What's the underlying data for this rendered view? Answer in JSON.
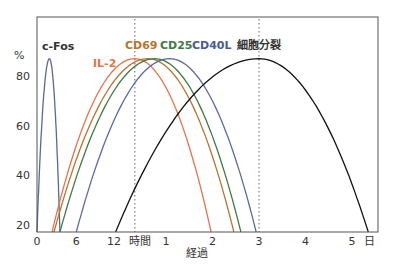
{
  "chart_data": {
    "type": "line",
    "title": "",
    "xlabel": "経過",
    "ylabel": "%",
    "ylim": [
      17,
      100
    ],
    "grid": false,
    "legend": "inline labels above curves",
    "x_axis": {
      "hour_ticks": [
        {
          "label": "0",
          "unit": "h",
          "value": 0
        },
        {
          "label": "6",
          "unit": "h",
          "value": 6
        },
        {
          "label": "12",
          "unit": "h",
          "value": 12
        }
      ],
      "hour_unit_label": "時間",
      "day_ticks": [
        {
          "label": "1",
          "unit": "d",
          "value": 1
        },
        {
          "label": "2",
          "unit": "d",
          "value": 2
        },
        {
          "label": "3",
          "unit": "d",
          "value": 3
        },
        {
          "label": "4",
          "unit": "d",
          "value": 4
        },
        {
          "label": "5",
          "unit": "d",
          "value": 5
        }
      ],
      "day_unit_label": "日"
    },
    "y_ticks": [
      80,
      60,
      40,
      20
    ],
    "reference_lines": [
      {
        "unit": "d",
        "value": 0.33,
        "style": "dotted"
      },
      {
        "unit": "d",
        "value": 3,
        "style": "dotted"
      }
    ],
    "series": [
      {
        "name": "c-Fos",
        "color": "#5a6a96",
        "label_weight": "normal",
        "label_color": "#333333",
        "start": {
          "unit": "h",
          "value": 0
        },
        "peak": {
          "unit": "h",
          "value": 1.9,
          "y": 87
        },
        "end": {
          "unit": "h",
          "value": 3.5
        }
      },
      {
        "name": "IL-2",
        "color": "#e8734a",
        "label_weight": "bold",
        "label_color": "#e8734a",
        "start": {
          "unit": "h",
          "value": 2.3
        },
        "peak": {
          "unit": "d",
          "value": 0.33,
          "y": 87
        },
        "end": {
          "unit": "d",
          "value": 1.97
        }
      },
      {
        "name": "CD69",
        "color": "#b8742e",
        "label_weight": "bold",
        "label_color": "#b8742e",
        "start": {
          "unit": "h",
          "value": 2.6
        },
        "peak": {
          "unit": "d",
          "value": 0.61,
          "y": 87
        },
        "end": {
          "unit": "d",
          "value": 2.46
        }
      },
      {
        "name": "CD25",
        "color": "#3f7a45",
        "label_weight": "bold",
        "label_color": "#3f7a45",
        "start": {
          "unit": "h",
          "value": 3.5
        },
        "peak": {
          "unit": "d",
          "value": 0.76,
          "y": 87
        },
        "end": {
          "unit": "d",
          "value": 2.61
        }
      },
      {
        "name": "CD40L",
        "color": "#5a6aa6",
        "label_weight": "bold",
        "label_color": "#4a5a96",
        "start": {
          "unit": "h",
          "value": 6
        },
        "peak": {
          "unit": "d",
          "value": 1.08,
          "y": 87
        },
        "end": {
          "unit": "d",
          "value": 2.94
        }
      },
      {
        "name": "細胞分裂",
        "color": "#111111",
        "label_weight": "normal",
        "label_color": "#333333",
        "start": {
          "unit": "h",
          "value": 12
        },
        "peak": {
          "unit": "d",
          "value": 3,
          "y": 87
        },
        "end": {
          "unit": "d",
          "value": 5.35
        }
      }
    ]
  }
}
